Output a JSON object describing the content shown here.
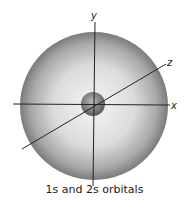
{
  "diagram": {
    "caption": "1s and 2s orbitals",
    "axes": {
      "x": "x",
      "y": "y",
      "z": "z"
    },
    "colors": {
      "outer_center": "#f2f2f2",
      "outer_edge": "#7a7a7a",
      "inner_center": "#b0b0b0",
      "inner_edge": "#5a5a5a",
      "axis": "#222222"
    }
  }
}
